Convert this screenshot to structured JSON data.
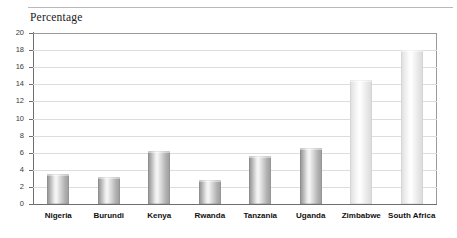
{
  "chart_data": {
    "type": "bar",
    "title": "Percentage",
    "xlabel": "",
    "ylabel": "",
    "ylim": [
      0,
      20
    ],
    "ytick_step": 2,
    "yticks": [
      0,
      2,
      4,
      6,
      8,
      10,
      12,
      14,
      16,
      18,
      20
    ],
    "grid": true,
    "legend": "none",
    "categories": [
      "Nigeria",
      "Burundi",
      "Kenya",
      "Rwanda",
      "Tanzania",
      "Uganda",
      "Zimbabwe",
      "South Africa"
    ],
    "values": [
      3.5,
      3.2,
      6.2,
      2.8,
      5.6,
      6.6,
      14.5,
      18.0
    ],
    "bar_styles": [
      "dark",
      "dark",
      "dark",
      "dark",
      "dark",
      "dark",
      "light",
      "light"
    ],
    "colors": {
      "bar_dark": "#b0b0b0",
      "bar_light": "#efefef",
      "gridline": "#dddddd",
      "axis": "#6e6e6e",
      "text": "#111111"
    }
  }
}
